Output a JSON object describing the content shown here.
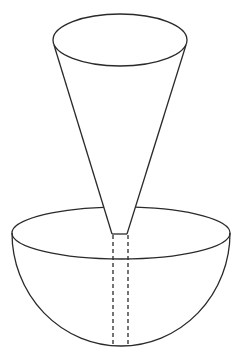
{
  "diagram": {
    "stroke_color": "#2a2a2a",
    "background": "#ffffff",
    "cone": {
      "top_ellipse": {
        "cx": 120,
        "cy": 40,
        "rx": 67,
        "ry": 26
      },
      "left_side": {
        "x1": 54,
        "y1": 45,
        "x2": 112,
        "y2": 234
      },
      "right_side": {
        "x1": 186,
        "y1": 45,
        "x2": 127,
        "y2": 234
      },
      "bottom": {
        "x1": 112,
        "y1": 234,
        "x2": 127,
        "y2": 234
      }
    },
    "hemisphere": {
      "rim_ellipse": {
        "cx": 121,
        "cy": 233,
        "rx": 109,
        "ry": 26
      },
      "bottom_y": 346
    },
    "dashed_lines": [
      {
        "x": 113,
        "y1": 235,
        "y2": 345
      },
      {
        "x": 128,
        "y1": 235,
        "y2": 345
      }
    ]
  }
}
